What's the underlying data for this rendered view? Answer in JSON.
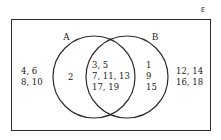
{
  "diagram": {
    "type": "venn",
    "universal_symbol": "ε",
    "sets": [
      {
        "name": "A",
        "label": "A"
      },
      {
        "name": "B",
        "label": "B"
      }
    ],
    "regions": {
      "outside": {
        "lines": [
          "4, 6",
          "8, 10"
        ]
      },
      "outside_right": {
        "lines": [
          "12, 14",
          "16, 18"
        ]
      },
      "a_only": {
        "lines": [
          "2"
        ]
      },
      "a_and_b": {
        "lines": [
          "3, 5",
          "7, 11, 13",
          "17, 19"
        ]
      },
      "b_only": {
        "lines": [
          "1",
          "9",
          "15"
        ]
      }
    },
    "colors": {
      "stroke": "#2a2a2a",
      "background": "#ffffff",
      "text": "#222222"
    }
  }
}
